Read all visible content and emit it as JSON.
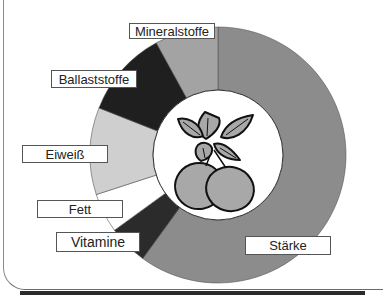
{
  "chart_data": {
    "type": "pie",
    "variant": "donut",
    "title": "",
    "categories": [
      "Stärke",
      "Vitamine",
      "Fett",
      "Eiweiß",
      "Ballaststoffe",
      "Mineralstoffe"
    ],
    "values": [
      60,
      5,
      5,
      11,
      11,
      8
    ],
    "unit": "% (estimated from segment angles)",
    "colors": [
      "#8c8c8c",
      "#2b2b2b",
      "#ffffff",
      "#cfcfcf",
      "#1f1f1f",
      "#a3a3a3"
    ],
    "start_angle": "top, clockwise",
    "center_image": "potato plant illustration (leaves and tubers)",
    "legend": "none — callout labels beside segments"
  },
  "labels": {
    "mineralstoffe": "Mineralstoffe",
    "ballaststoffe": "Ballaststoffe",
    "eiweiss": "Eiweiß",
    "fett": "Fett",
    "vitamine": "Vitamine",
    "staerke": "Stärke"
  }
}
